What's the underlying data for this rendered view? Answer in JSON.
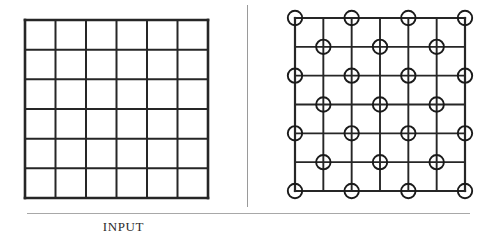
{
  "figure": {
    "type": "diagram",
    "background_color": "#ffffff",
    "line_color": "#262626",
    "rule_color": "#a8a8a8",
    "divider_color": "#9a9a9a"
  },
  "panels": [
    {
      "id": "input",
      "caption": "INPUT",
      "grid": {
        "rows": 6,
        "cols": 6,
        "intersections_rows": 7,
        "intersections_cols": 7,
        "cell_width": 30.5,
        "cell_height": 29.7,
        "origin_x": 25,
        "origin_y": 20,
        "width": 183,
        "height": 178,
        "stroke_width_outer": 2.6,
        "stroke_width_inner": 2.0,
        "stroke_color": "#262626",
        "nodes": []
      }
    },
    {
      "id": "output",
      "caption": "OUTPUT",
      "grid": {
        "rows": 6,
        "cols": 6,
        "intersections_rows": 7,
        "intersections_cols": 7,
        "cell_width": 28.3,
        "cell_height": 28.8,
        "origin_x": 295,
        "origin_y": 18,
        "width": 170,
        "height": 173,
        "stroke_width_outer": 2.2,
        "stroke_width_inner": 1.9,
        "stroke_color": "#262626",
        "node_rule": "circle drawn at every intersection (r,c) where (r + c) is even",
        "node_radius": 7.2,
        "node_stroke_width": 1.9,
        "node_stroke_color": "#1a1a1a",
        "node_fill": "#ffffff",
        "node_count": 25,
        "nodes": [
          {
            "row": 0,
            "col": 0
          },
          {
            "row": 0,
            "col": 2
          },
          {
            "row": 0,
            "col": 4
          },
          {
            "row": 0,
            "col": 6
          },
          {
            "row": 1,
            "col": 1
          },
          {
            "row": 1,
            "col": 3
          },
          {
            "row": 1,
            "col": 5
          },
          {
            "row": 2,
            "col": 0
          },
          {
            "row": 2,
            "col": 2
          },
          {
            "row": 2,
            "col": 4
          },
          {
            "row": 2,
            "col": 6
          },
          {
            "row": 3,
            "col": 1
          },
          {
            "row": 3,
            "col": 3
          },
          {
            "row": 3,
            "col": 5
          },
          {
            "row": 4,
            "col": 0
          },
          {
            "row": 4,
            "col": 2
          },
          {
            "row": 4,
            "col": 4
          },
          {
            "row": 4,
            "col": 6
          },
          {
            "row": 5,
            "col": 1
          },
          {
            "row": 5,
            "col": 3
          },
          {
            "row": 5,
            "col": 5
          },
          {
            "row": 6,
            "col": 0
          },
          {
            "row": 6,
            "col": 2
          },
          {
            "row": 6,
            "col": 4
          },
          {
            "row": 6,
            "col": 6
          }
        ]
      }
    }
  ],
  "divider": {
    "orientation": "vertical",
    "x": 247,
    "y_start": 5,
    "y_end": 207
  },
  "caption_rule": {
    "orientation": "horizontal",
    "y": 213,
    "x_start": 27,
    "x_end": 470
  }
}
